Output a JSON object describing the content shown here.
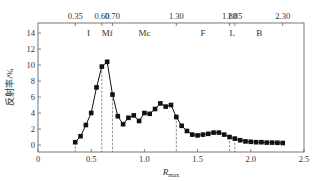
{
  "chart_data": {
    "type": "line",
    "title": "",
    "xlabel": "R",
    "xlabel_sub": "max",
    "ylabel": "反射率/%",
    "xlim": [
      0,
      2.5
    ],
    "ylim": [
      -0.8,
      15
    ],
    "x_ticks": [
      0,
      0.5,
      1.0,
      1.5,
      2.0,
      2.5
    ],
    "x_tick_labels": [
      "0",
      "0.5",
      "1.0",
      "1.5",
      "2.0",
      "2.5"
    ],
    "y_ticks": [
      0,
      2,
      4,
      6,
      8,
      10,
      12,
      14
    ],
    "y_tick_labels": [
      "0",
      "2",
      "4",
      "6",
      "8",
      "10",
      "12",
      "14"
    ],
    "grid": false,
    "legend": null,
    "top_ticks": [
      {
        "x": 0.35,
        "label": "0.35"
      },
      {
        "x": 0.6,
        "label": "0.60"
      },
      {
        "x": 0.7,
        "label": "0.70"
      },
      {
        "x": 1.3,
        "label": "1.30"
      },
      {
        "x": 1.8,
        "label": "1.80"
      },
      {
        "x": 1.85,
        "label": "1.85"
      },
      {
        "x": 2.3,
        "label": "2.30"
      }
    ],
    "regions": [
      {
        "label": "I",
        "x": 0.475
      },
      {
        "label": "Mf",
        "x": 0.65
      },
      {
        "label": "Mc",
        "x": 1.0
      },
      {
        "label": "F",
        "x": 1.55
      },
      {
        "label": "L",
        "x": 1.825
      },
      {
        "label": "B",
        "x": 2.08
      }
    ],
    "dashed_lines": [
      0.35,
      0.6,
      0.7,
      1.3,
      1.8,
      1.85
    ],
    "series": [
      {
        "name": "反射率",
        "marker": "square",
        "x": [
          0.35,
          0.4,
          0.45,
          0.5,
          0.55,
          0.6,
          0.65,
          0.7,
          0.75,
          0.8,
          0.85,
          0.9,
          0.95,
          1.0,
          1.05,
          1.1,
          1.15,
          1.2,
          1.25,
          1.3,
          1.35,
          1.4,
          1.45,
          1.5,
          1.55,
          1.6,
          1.65,
          1.7,
          1.75,
          1.8,
          1.85,
          1.9,
          1.95,
          2.0,
          2.05,
          2.1,
          2.15,
          2.2,
          2.25,
          2.3
        ],
        "y": [
          0.35,
          1.1,
          2.5,
          4.0,
          7.2,
          9.8,
          10.4,
          6.3,
          3.6,
          2.6,
          3.4,
          3.7,
          3.0,
          4.0,
          3.9,
          4.5,
          5.2,
          4.8,
          5.0,
          3.5,
          2.4,
          1.75,
          1.3,
          1.2,
          1.3,
          1.4,
          1.55,
          1.55,
          1.3,
          1.0,
          0.8,
          0.6,
          0.45,
          0.4,
          0.35,
          0.35,
          0.3,
          0.3,
          0.28,
          0.25
        ]
      }
    ]
  }
}
